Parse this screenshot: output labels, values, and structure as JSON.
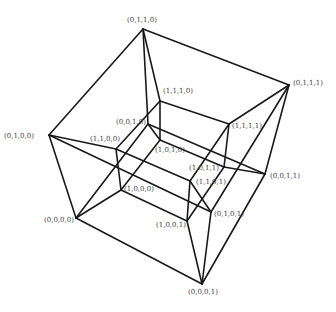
{
  "diagram": {
    "type": "tesseract-projection",
    "vertices": [
      {
        "id": "0000",
        "label": "(0,0,0,0)",
        "x": 76,
        "y": 218,
        "lx": 44,
        "ly": 222
      },
      {
        "id": "1000",
        "label": "(1,0,0,0)",
        "x": 121,
        "y": 190,
        "lx": 124,
        "ly": 191
      },
      {
        "id": "0100",
        "label": "(0,1,0,0)",
        "x": 49,
        "y": 135,
        "lx": 4,
        "ly": 138
      },
      {
        "id": "1100",
        "label": "(1,1,0,0)",
        "x": 116,
        "y": 149,
        "lx": 90,
        "ly": 141
      },
      {
        "id": "0010",
        "label": "(0,0,1,0)",
        "x": 148,
        "y": 124,
        "lx": 116,
        "ly": 124
      },
      {
        "id": "1010",
        "label": "(1,0,1,0)",
        "x": 160,
        "y": 140,
        "lx": 155,
        "ly": 152
      },
      {
        "id": "0110",
        "label": "(0,1,1,0)",
        "x": 143,
        "y": 29,
        "lx": 127,
        "ly": 22
      },
      {
        "id": "1110",
        "label": "(1,1,1,0)",
        "x": 160,
        "y": 101,
        "lx": 163,
        "ly": 93
      },
      {
        "id": "0001",
        "label": "(0,0,0,1)",
        "x": 202,
        "y": 284,
        "lx": 188,
        "ly": 294
      },
      {
        "id": "1001",
        "label": "(1,0,0,1)",
        "x": 187,
        "y": 221,
        "lx": 156,
        "ly": 227
      },
      {
        "id": "0101",
        "label": "(0,1,0,1)",
        "x": 211,
        "y": 212,
        "lx": 214,
        "ly": 216
      },
      {
        "id": "1101",
        "label": "(1,1,0,1)",
        "x": 190,
        "y": 181,
        "lx": 196,
        "ly": 184
      },
      {
        "id": "0011",
        "label": "(0,0,1,1)",
        "x": 265,
        "y": 174,
        "lx": 270,
        "ly": 178
      },
      {
        "id": "1011",
        "label": "(1,0,1,1)",
        "x": 224,
        "y": 167,
        "lx": 189,
        "ly": 170
      },
      {
        "id": "0111",
        "label": "(0,1,1,1)",
        "x": 289,
        "y": 85,
        "lx": 293,
        "ly": 85
      },
      {
        "id": "1111",
        "label": "(1,1,1,1)",
        "x": 229,
        "y": 124,
        "lx": 232,
        "ly": 128
      }
    ]
  }
}
